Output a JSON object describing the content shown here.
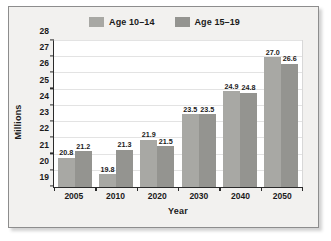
{
  "chart_data": {
    "type": "bar",
    "title": "",
    "xlabel": "Year",
    "ylabel": "Millions",
    "categories": [
      "2005",
      "2010",
      "2020",
      "2030",
      "2040",
      "2050"
    ],
    "series": [
      {
        "name": "Age 10–14",
        "color": "#a8a8a4",
        "values": [
          20.8,
          19.8,
          21.9,
          23.5,
          24.9,
          27.0
        ],
        "labels": [
          "20.8",
          "19.8",
          "21.9",
          "23.5",
          "24.9",
          "27.0"
        ]
      },
      {
        "name": "Age 15–19",
        "color": "#949490",
        "values": [
          21.2,
          21.3,
          21.5,
          23.5,
          24.8,
          26.6
        ],
        "labels": [
          "21.2",
          "21.3",
          "21.5",
          "23.5",
          "24.8",
          "26.6"
        ]
      }
    ],
    "ylim": [
      19,
      28
    ],
    "yticks": [
      "28",
      "27",
      "26",
      "25",
      "24",
      "23",
      "22",
      "21",
      "20",
      "19"
    ],
    "grid": true,
    "legend_position": "top-center"
  },
  "figure": {
    "background": "#f2f1ef",
    "plot_background": "#ffffff",
    "border_color": "#8d8d8d",
    "axis_color": "#2b2b2b",
    "gridline_color": "#e3e3e3"
  }
}
